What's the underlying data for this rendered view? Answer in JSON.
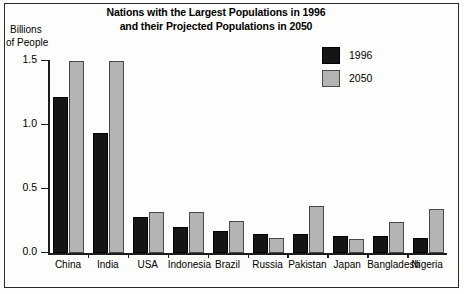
{
  "chart_data": {
    "type": "bar",
    "title": "Nations with the Largest Populations in 1996 and their Projected Populations in 2050",
    "title_line1": "Nations with the Largest Populations in 1996",
    "title_line2": "and their Projected Populations in 2050",
    "ylabel_line1": "Billions",
    "ylabel_line2": "of People",
    "xlabel": "",
    "ylim": [
      0.0,
      1.5
    ],
    "yticks": [
      0.0,
      0.5,
      1.0,
      1.5
    ],
    "ytick_labels": [
      "0.0",
      "0.5",
      "1.0",
      "1.5"
    ],
    "grid": false,
    "legend_position": "top-right",
    "categories": [
      "China",
      "India",
      "USA",
      "Indonesia",
      "Brazil",
      "Russia",
      "Pakistan",
      "Japan",
      "Bangladesh",
      "Nigeria"
    ],
    "series": [
      {
        "name": "1996",
        "color": "#151515",
        "values": [
          1.22,
          0.94,
          0.28,
          0.2,
          0.17,
          0.15,
          0.15,
          0.13,
          0.13,
          0.12
        ]
      },
      {
        "name": "2050",
        "color": "#b4b4b4",
        "values": [
          1.5,
          1.5,
          0.32,
          0.32,
          0.25,
          0.12,
          0.37,
          0.11,
          0.24,
          0.34
        ]
      }
    ]
  },
  "legend": {
    "items": [
      {
        "label": "1996",
        "swatch": "black-swatch"
      },
      {
        "label": "2050",
        "swatch": "gray-swatch"
      }
    ]
  }
}
